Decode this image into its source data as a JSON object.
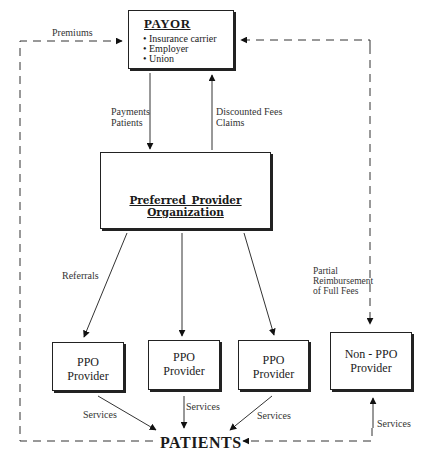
{
  "diagram": {
    "type": "flow",
    "payor": {
      "title": "PAYOR",
      "items": [
        "Insurance carrier",
        "Employer",
        "Union"
      ]
    },
    "ppo": {
      "title": "Preferred Provider Organization"
    },
    "providers": [
      {
        "line1": "PPO",
        "line2": "Provider"
      },
      {
        "line1": "PPO",
        "line2": "Provider"
      },
      {
        "line1": "PPO",
        "line2": "Provider"
      },
      {
        "line1": "Non - PPO",
        "line2": "Provider"
      }
    ],
    "patients": "PATIENTS",
    "edge_labels": {
      "premiums": "Premiums",
      "payments_1": "Payments",
      "payments_2": "Patients",
      "discounted_1": "Discounted Fees",
      "discounted_2": "Claims",
      "referrals": "Referrals",
      "partial_1": "Partial",
      "partial_2": "Reimbursement",
      "partial_3": "of Full Fees",
      "services": "Services"
    },
    "edges": [
      {
        "from": "PATIENTS",
        "to": "PAYOR",
        "label": "Premiums",
        "style": "dashed"
      },
      {
        "from": "PAYOR",
        "to": "Preferred Provider Organization",
        "label": "Payments Patients",
        "style": "solid"
      },
      {
        "from": "Preferred Provider Organization",
        "to": "PAYOR",
        "label": "Discounted Fees Claims",
        "style": "solid"
      },
      {
        "from": "Preferred Provider Organization",
        "to": "PPO Provider 1",
        "label": "Referrals",
        "style": "solid"
      },
      {
        "from": "Preferred Provider Organization",
        "to": "PPO Provider 2",
        "label": "",
        "style": "solid"
      },
      {
        "from": "Preferred Provider Organization",
        "to": "PPO Provider 3",
        "label": "",
        "style": "solid"
      },
      {
        "from": "PAYOR",
        "to": "Non - PPO Provider",
        "label": "Partial Reimbursement of Full Fees",
        "style": "dashed"
      },
      {
        "from": "Non - PPO Provider",
        "to": "PAYOR",
        "label": "",
        "style": "dashed"
      },
      {
        "from": "PPO Provider 1",
        "to": "PATIENTS",
        "label": "Services",
        "style": "solid"
      },
      {
        "from": "PPO Provider 2",
        "to": "PATIENTS",
        "label": "Services",
        "style": "solid"
      },
      {
        "from": "PPO Provider 3",
        "to": "PATIENTS",
        "label": "Services",
        "style": "solid"
      },
      {
        "from": "PATIENTS",
        "to": "Non - PPO Provider",
        "label": "Services",
        "style": "solid"
      },
      {
        "from": "Non - PPO Provider",
        "to": "PATIENTS",
        "label": "",
        "style": "dashed"
      }
    ]
  }
}
